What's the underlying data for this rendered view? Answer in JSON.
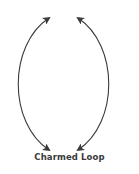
{
  "diagram": {
    "caption": "Charmed Loop",
    "stroke_color": "#3a3a3a",
    "arrows": [
      {
        "name": "left-arc",
        "from": "top",
        "to": "bottom",
        "heads": "both"
      },
      {
        "name": "right-arc",
        "from": "top",
        "to": "bottom",
        "heads": "both"
      }
    ]
  }
}
